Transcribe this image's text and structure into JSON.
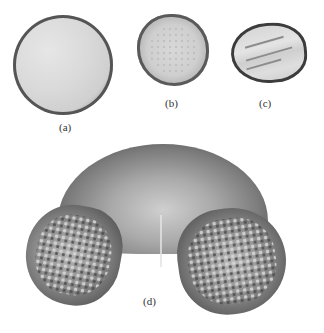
{
  "figure": {
    "panels": [
      {
        "id": "a",
        "label": "(a)",
        "shape": "round, three-lobed (tricolpate)"
      },
      {
        "id": "b",
        "label": "(b)",
        "shape": "small, pentagonal, finely granular"
      },
      {
        "id": "c",
        "label": "(c)",
        "shape": "oval with longitudinal streaks"
      },
      {
        "id": "d",
        "label": "(d)",
        "shape": "large, bisaccate with reticulate air sacs"
      }
    ]
  }
}
